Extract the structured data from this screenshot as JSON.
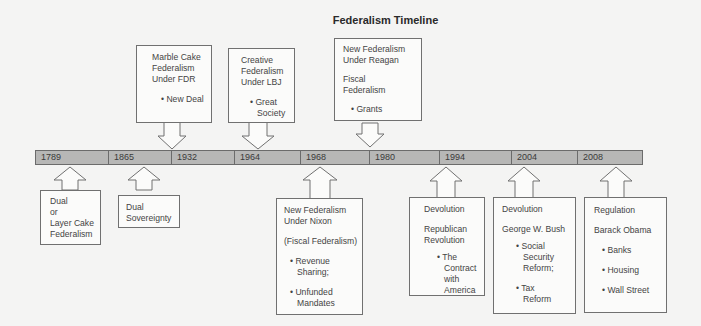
{
  "title": "Federalism Timeline",
  "colors": {
    "background": "#f4f4f3",
    "bar_fill": "#b7b7b6",
    "bar_border": "#6b6b6b",
    "box_fill": "#fbfbfa",
    "box_border": "#707070",
    "text": "#3a3a3a"
  },
  "timeline": {
    "years": [
      "1789",
      "1865",
      "1932",
      "1964",
      "1968",
      "1980",
      "1994",
      "2004",
      "2008"
    ]
  },
  "above": [
    {
      "year": "1932",
      "heading": [
        "Marble Cake",
        "Federalism",
        "Under FDR"
      ],
      "bullets": [
        "New Deal"
      ]
    },
    {
      "year": "1964",
      "heading": [
        "Creative",
        "Federalism",
        "Under LBJ"
      ],
      "bullets": [
        "Great Society"
      ]
    },
    {
      "year": "1980",
      "heading": [
        "New Federalism",
        "Under Reagan"
      ],
      "subheading": [
        "Fiscal",
        "Federalism"
      ],
      "bullets": [
        "Grants"
      ]
    }
  ],
  "below": [
    {
      "year": "1789",
      "heading": [
        "Dual",
        "or",
        "Layer Cake",
        "Federalism"
      ]
    },
    {
      "year": "1865",
      "heading": [
        "Dual",
        "Sovereignty"
      ]
    },
    {
      "year": "1968",
      "heading": [
        "New Federalism",
        "Under Nixon"
      ],
      "subheading": "(Fiscal Federalism)",
      "bullets": [
        "Revenue Sharing;",
        "Unfunded Mandates"
      ]
    },
    {
      "year": "1994",
      "heading": "Devolution",
      "subheading": [
        "Republican",
        "Revolution"
      ],
      "bullets": [
        "The Contract with America"
      ]
    },
    {
      "year": "2004",
      "heading": "Devolution",
      "subheading": "George W. Bush",
      "bullets": [
        "Social Security Reform;",
        "Tax Reform"
      ]
    },
    {
      "year": "2008",
      "heading": "Regulation",
      "subheading": "Barack Obama",
      "bullets": [
        "Banks",
        "Housing",
        "Wall Street"
      ]
    }
  ]
}
